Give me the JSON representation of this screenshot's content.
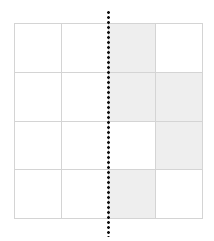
{
  "diagram": {
    "type": "grid",
    "rows": 4,
    "cols": 4,
    "shaded_cells": [
      [
        0,
        2
      ],
      [
        1,
        2
      ],
      [
        1,
        3
      ],
      [
        2,
        3
      ],
      [
        3,
        2
      ]
    ],
    "colors": {
      "shaded": "#eeeeee",
      "empty": "#ffffff",
      "gridline": "#d4d4d4",
      "fold_line": "#111111"
    },
    "fold_line": {
      "orientation": "vertical",
      "style": "dotted",
      "position": "between column 2 and column 3"
    }
  }
}
